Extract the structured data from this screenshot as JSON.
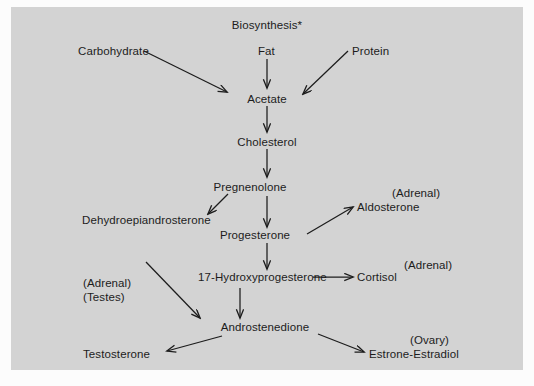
{
  "figure": {
    "title": "Biosynthesis*",
    "panel_color": "#d3d3d3",
    "page_color": "#fcfcfc",
    "ink_color": "#1c1c1c",
    "type": "flowchart"
  },
  "nodes": [
    {
      "id": "biosynthesis",
      "label": "Biosynthesis*",
      "x": 267,
      "y": 26,
      "align": "center"
    },
    {
      "id": "carbohydrate",
      "label": "Carbohydrate",
      "x": 78,
      "y": 52,
      "align": "left"
    },
    {
      "id": "fat",
      "label": "Fat",
      "x": 258,
      "y": 52,
      "align": "left"
    },
    {
      "id": "protein",
      "label": "Protein",
      "x": 352,
      "y": 52,
      "align": "left"
    },
    {
      "id": "acetate",
      "label": "Acetate",
      "x": 267,
      "y": 100,
      "align": "center"
    },
    {
      "id": "cholesterol",
      "label": "Cholesterol",
      "x": 267,
      "y": 143,
      "align": "center"
    },
    {
      "id": "pregnenolone",
      "label": "Pregnenolone",
      "x": 250,
      "y": 189,
      "align": "center"
    },
    {
      "id": "dehydroepiandrosterone",
      "label": "Dehydroepiandrosterone",
      "x": 82,
      "y": 221,
      "align": "left"
    },
    {
      "id": "progesterone",
      "label": "Progesterone",
      "x": 255,
      "y": 237,
      "align": "center"
    },
    {
      "id": "aldosterone",
      "label": "Aldosterone",
      "x": 357,
      "y": 208,
      "align": "left"
    },
    {
      "id": "hydroxyprogesterone",
      "label": "17-Hydroxyprogesterone",
      "x": 198,
      "y": 280,
      "align": "left"
    },
    {
      "id": "cortisol",
      "label": "Cortisol",
      "x": 357,
      "y": 280,
      "align": "left"
    },
    {
      "id": "androstenedione",
      "label": "Androstenedione",
      "x": 265,
      "y": 330,
      "align": "center"
    },
    {
      "id": "testosterone",
      "label": "Testosterone",
      "x": 83,
      "y": 355,
      "align": "left"
    },
    {
      "id": "estrone_estradiol",
      "label": "Estrone-Estradiol",
      "x": 369,
      "y": 355,
      "align": "left"
    }
  ],
  "tissue_labels": [
    {
      "id": "adrenal-aldosterone",
      "label": "(Adrenal)",
      "x": 392,
      "y": 193,
      "align": "left"
    },
    {
      "id": "adrenal-testes",
      "label": "(Adrenal)",
      "x": 83,
      "y": 283,
      "align": "left"
    },
    {
      "id": "testes",
      "label": "(Testes)",
      "x": 83,
      "y": 297,
      "align": "left"
    },
    {
      "id": "adrenal-cortisol",
      "label": "(Adrenal)",
      "x": 404,
      "y": 265,
      "align": "left"
    },
    {
      "id": "ovary",
      "label": "(Ovary)",
      "x": 410,
      "y": 340,
      "align": "left"
    }
  ],
  "edges": [
    {
      "id": "fat-to-acetate",
      "from": "fat",
      "to": "acetate",
      "kind": "vertical"
    },
    {
      "id": "carbohydrate-to-acetate",
      "from": "carbohydrate",
      "to": "acetate",
      "kind": "diagonal"
    },
    {
      "id": "protein-to-acetate",
      "from": "protein",
      "to": "acetate",
      "kind": "diagonal"
    },
    {
      "id": "acetate-to-cholesterol",
      "from": "acetate",
      "to": "cholesterol",
      "kind": "vertical"
    },
    {
      "id": "cholesterol-to-pregnenolone",
      "from": "cholesterol",
      "to": "pregnenolone",
      "kind": "vertical"
    },
    {
      "id": "pregnenolone-to-dehydroepiandrosterone",
      "from": "pregnenolone",
      "to": "dehydroepiandrosterone",
      "kind": "diagonal"
    },
    {
      "id": "pregnenolone-to-progesterone",
      "from": "pregnenolone",
      "to": "progesterone",
      "kind": "vertical"
    },
    {
      "id": "progesterone-to-aldosterone",
      "from": "progesterone",
      "to": "aldosterone",
      "kind": "diagonal"
    },
    {
      "id": "progesterone-to-hydroxyprogesterone",
      "from": "progesterone",
      "to": "hydroxyprogesterone",
      "kind": "vertical"
    },
    {
      "id": "hydroxyprogesterone-to-cortisol",
      "from": "hydroxyprogesterone",
      "to": "cortisol",
      "kind": "horizontal"
    },
    {
      "id": "dehydroepiandrosterone-to-androstenedione",
      "from": "dehydroepiandrosterone",
      "to": "androstenedione",
      "kind": "diagonal"
    },
    {
      "id": "hydroxyprogesterone-to-androstenedione",
      "from": "hydroxyprogesterone",
      "to": "androstenedione",
      "kind": "vertical"
    },
    {
      "id": "androstenedione-to-testosterone",
      "from": "androstenedione",
      "to": "testosterone",
      "kind": "diagonal"
    },
    {
      "id": "androstenedione-to-estrone-estradiol",
      "from": "androstenedione",
      "to": "estrone_estradiol",
      "kind": "diagonal"
    }
  ]
}
